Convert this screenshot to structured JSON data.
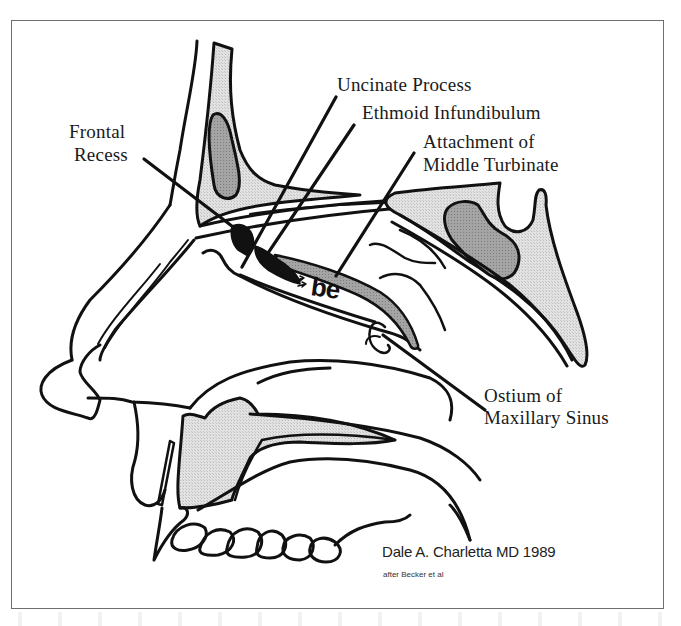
{
  "figure": {
    "type": "anatomical-line-drawing",
    "labels": {
      "frontal_recess_line1": "Frontal",
      "frontal_recess_line2": "Recess",
      "uncinate_process": "Uncinate Process",
      "ethmoid_infundibulum": "Ethmoid Infundibulum",
      "middle_turbinate_line1": "Attachment of",
      "middle_turbinate_line2": "Middle Turbinate",
      "maxillary_ostium_line1": "Ostium of",
      "maxillary_ostium_line2": "Maxillary Sinus",
      "bulla_ethmoidalis_abbrev": "be"
    },
    "credit": {
      "author": "Dale A. Charletta MD  1989",
      "source": "after Becker et al"
    },
    "colors": {
      "line": "#111111",
      "bone_fill": "#dcdcdc",
      "sinus_fill": "#9e9e9e",
      "frame": "#6e6e6e",
      "background": "#ffffff"
    }
  }
}
